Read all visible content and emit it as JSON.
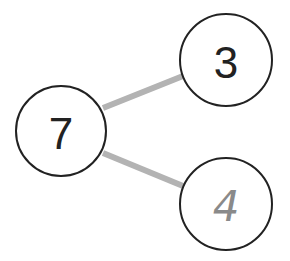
{
  "diagram": {
    "type": "number-bond",
    "whole": {
      "value": "7",
      "color": "#222222"
    },
    "parts": [
      {
        "value": "3",
        "color": "#222222",
        "style": "printed"
      },
      {
        "value": "4",
        "color": "#8a8a8a",
        "style": "handwritten"
      }
    ],
    "connector_color": "#b3b3b3",
    "circle_stroke": "#222222"
  }
}
